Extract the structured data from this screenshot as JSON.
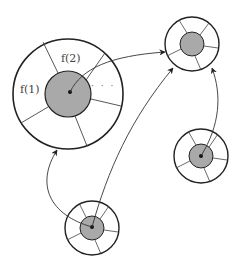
{
  "diagram": {
    "type": "linked nodes with pointer tables",
    "colors": {
      "stroke": "#222222",
      "inner_fill": "#a9a9a9",
      "arrow": "#333333",
      "background": "#ffffff"
    },
    "nodes": [
      {
        "id": "big",
        "cx": 68,
        "cy": 94,
        "r_outer": 55,
        "r_inner": 23,
        "labels": {
          "slot1": "f(1)",
          "slot2": "f(2)",
          "more": "· · ·"
        }
      },
      {
        "id": "top-right",
        "cx": 192,
        "cy": 44,
        "r_outer": 27,
        "r_inner": 12
      },
      {
        "id": "bottom-right",
        "cx": 201,
        "cy": 156,
        "r_outer": 27,
        "r_inner": 12
      },
      {
        "id": "bottom",
        "cx": 92,
        "cy": 228,
        "r_outer": 27,
        "r_inner": 12
      }
    ],
    "edges": [
      {
        "from": "big",
        "to": "top-right"
      },
      {
        "from": "bottom",
        "to": "big"
      },
      {
        "from": "bottom",
        "to": "top-right"
      },
      {
        "from": "bottom-right",
        "to": "top-right"
      }
    ]
  }
}
